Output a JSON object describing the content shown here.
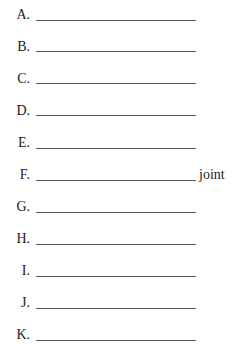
{
  "worksheet": {
    "rows": [
      {
        "label": "A.",
        "suffix": ""
      },
      {
        "label": "B.",
        "suffix": ""
      },
      {
        "label": "C.",
        "suffix": ""
      },
      {
        "label": "D.",
        "suffix": ""
      },
      {
        "label": "E.",
        "suffix": ""
      },
      {
        "label": "F.",
        "suffix": "joint"
      },
      {
        "label": "G.",
        "suffix": ""
      },
      {
        "label": "H.",
        "suffix": ""
      },
      {
        "label": "I.",
        "suffix": ""
      },
      {
        "label": "J.",
        "suffix": ""
      },
      {
        "label": "K.",
        "suffix": ""
      }
    ]
  }
}
